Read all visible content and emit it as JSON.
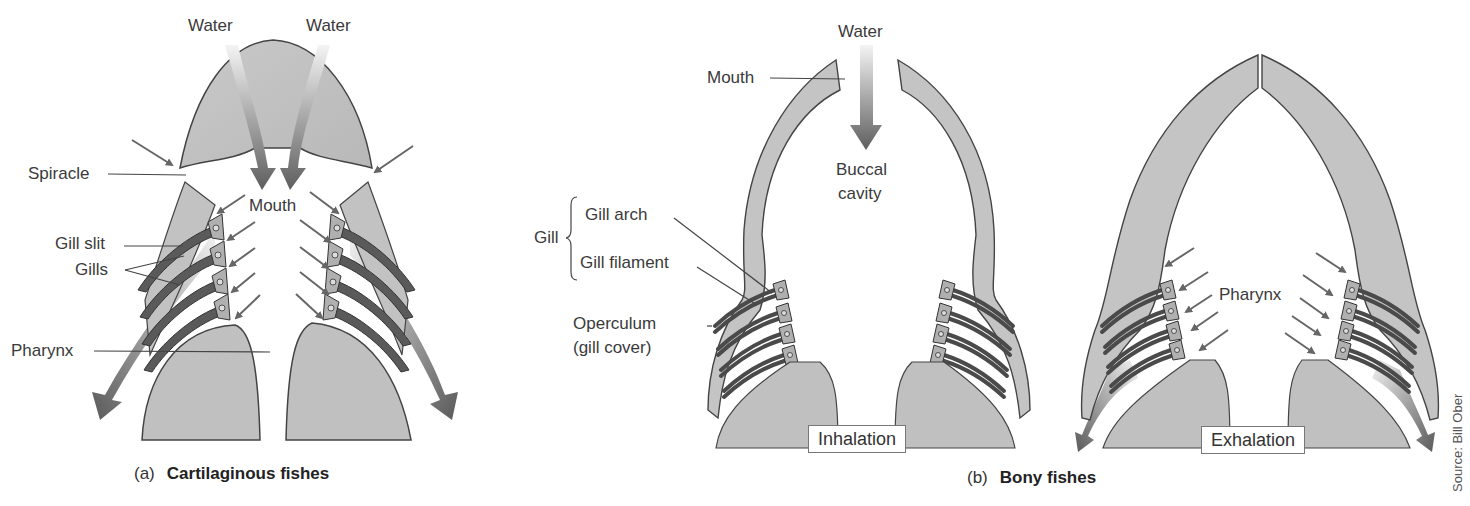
{
  "panel_a": {
    "caption_letter": "(a)",
    "caption_title": "Cartilaginous fishes",
    "labels": {
      "water_left": "Water",
      "water_right": "Water",
      "spiracle": "Spiracle",
      "mouth": "Mouth",
      "gill_slit": "Gill slit",
      "gills": "Gills",
      "pharynx": "Pharynx"
    }
  },
  "panel_b": {
    "caption_letter": "(b)",
    "caption_title": "Bony fishes",
    "labels": {
      "water": "Water",
      "mouth": "Mouth",
      "buccal_line1": "Buccal",
      "buccal_line2": "cavity",
      "gill": "Gill",
      "gill_arch": "Gill arch",
      "gill_filament": "Gill filament",
      "operculum_line1": "Operculum",
      "operculum_line2": "(gill cover)",
      "pharynx": "Pharynx"
    },
    "phases": {
      "inhalation": "Inhalation",
      "exhalation": "Exhalation"
    }
  },
  "credit": "Source: Bill Ober",
  "colors": {
    "tissue": "#c4c4c4",
    "tissue_outline": "#444444",
    "gill_dark": "#5a5a5a",
    "arrow": "#666666",
    "text": "#3a3a3a"
  }
}
